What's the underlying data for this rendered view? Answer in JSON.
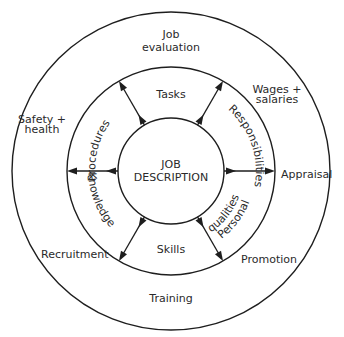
{
  "diagram": {
    "center": {
      "line1": "JOB",
      "line2": "DESCRIPTION"
    },
    "inner_ring": {
      "top": "Tasks",
      "upper_right": "Responsibilities",
      "lower_right_line1": "Personal",
      "lower_right_line2": "qualities",
      "bottom": "Skills",
      "lower_left": "Knowledge",
      "upper_left": "Procedures"
    },
    "outer_ring": {
      "top_line1": "Job",
      "top_line2": "evaluation",
      "upper_right_line1": "Wages +",
      "upper_right_line2": "salaries",
      "right": "Appraisal",
      "lower_right": "Promotion",
      "bottom": "Training",
      "lower_left": "Recruitment",
      "upper_left_line1": "Safety +",
      "upper_left_line2": "health"
    },
    "arrows": [
      {
        "angle_deg": 0,
        "direction": "outward"
      },
      {
        "angle_deg": 60,
        "direction": "outward"
      },
      {
        "angle_deg": 120,
        "direction": "outward"
      },
      {
        "angle_deg": 180,
        "direction": "outward"
      },
      {
        "angle_deg": 240,
        "direction": "outward"
      },
      {
        "angle_deg": 300,
        "direction": "outward"
      }
    ],
    "geometry": {
      "center_x": 171,
      "center_y": 171,
      "inner_radius": 53,
      "middle_radius": 104,
      "outer_radius": 159
    },
    "colors": {
      "line": "#1e1e1e",
      "text": "#2a2a2a",
      "background": "#ffffff"
    }
  }
}
